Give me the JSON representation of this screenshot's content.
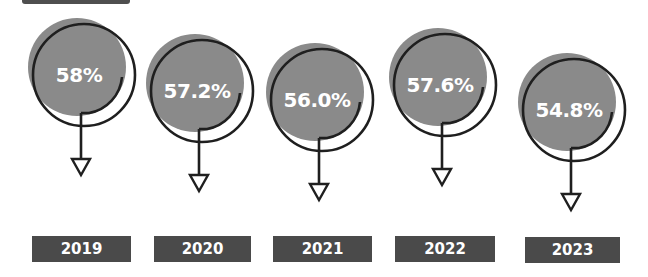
{
  "chart_data": {
    "type": "bar",
    "title": "",
    "xlabel": "",
    "ylabel": "",
    "categories": [
      "2019",
      "2020",
      "2021",
      "2022",
      "2023"
    ],
    "values": [
      58.0,
      57.2,
      56.0,
      57.6,
      54.8
    ],
    "value_labels": [
      "58%",
      "57.2%",
      "56.0%",
      "57.6%",
      "54.8%"
    ],
    "unit": "%",
    "trend": "down-arrow markers under each value",
    "grid": false,
    "legend": "none"
  },
  "colors": {
    "circle_fill": "#8a8a8a",
    "outline": "#1f1f1f",
    "label_box": "#4a4a4a",
    "label_text": "#ffffff"
  },
  "icons": {
    "marker": "down-arrow-triangle-icon"
  }
}
